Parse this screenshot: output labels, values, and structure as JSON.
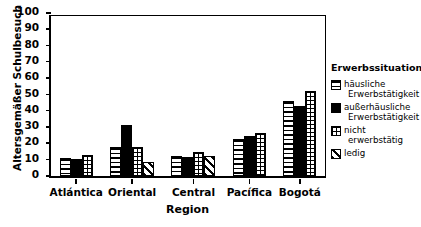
{
  "chart_data": {
    "type": "bar",
    "title": "",
    "subtitle": "",
    "xlabel": "Region",
    "ylabel": "Altersgemäßer Schulbesuch",
    "categories": [
      "Atlántica",
      "Oriental",
      "Central",
      "Pacífica",
      "Bogotá"
    ],
    "ylim": [
      0,
      100
    ],
    "yticks": [
      0,
      10,
      20,
      30,
      40,
      50,
      60,
      70,
      80,
      90,
      100
    ],
    "grid": false,
    "legend_position": "right",
    "legend_title": "Erwerbssituation",
    "series": [
      {
        "name": "häusliche Erwerbstätigkeit",
        "pattern": "horizontal-lines",
        "values": [
          11,
          17.5,
          12.5,
          23,
          46
        ]
      },
      {
        "name": "außerhäusliche Erwerbstätigkeit",
        "pattern": "solid-black",
        "values": [
          10.5,
          31.5,
          11.5,
          24.5,
          43
        ]
      },
      {
        "name": "nicht erwerbstätig",
        "pattern": "grid",
        "values": [
          13,
          17.5,
          14.5,
          26.5,
          52
        ]
      },
      {
        "name": "ledig",
        "pattern": "diagonal-hatch",
        "values": [
          null,
          8.5,
          12.5,
          null,
          null
        ]
      }
    ]
  },
  "axes": {
    "y_title": "Altersgemäßer Schulbesuch",
    "x_title": "Region",
    "y_tick_labels": [
      "0",
      "10",
      "20",
      "30",
      "40",
      "50",
      "60",
      "70",
      "80",
      "90",
      "100"
    ],
    "x_tick_labels": [
      "Atlántica",
      "Oriental",
      "Central",
      "Pacífica",
      "Bogotá"
    ]
  },
  "legend": {
    "title": "Erwerbssituation",
    "items": [
      {
        "line1": "häusliche",
        "line2": "Erwerbstätigkeit",
        "pattern": "horizontal-lines"
      },
      {
        "line1": "außerhäusliche",
        "line2": "Erwerbstätigkeit",
        "pattern": "solid-black"
      },
      {
        "line1": "nicht",
        "line2": "erwerbstätig",
        "pattern": "grid"
      },
      {
        "line1": "ledig",
        "line2": "",
        "pattern": "diagonal-hatch"
      }
    ]
  }
}
